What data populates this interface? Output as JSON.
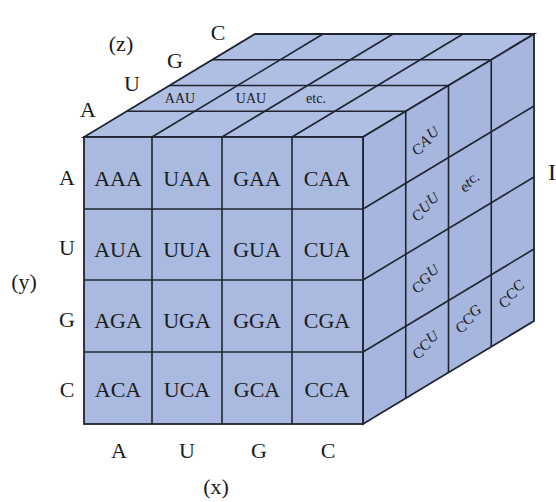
{
  "figure": {
    "colors": {
      "face_fill": "#a9b9e0",
      "face_fill_top": "#afbfe3",
      "face_fill_side": "#a6b6de",
      "line": "#1f2430",
      "text": "#1a1a1a",
      "background": "#ffffff"
    },
    "geometry": {
      "front_x": [
        84,
        152,
        222,
        292,
        363
      ],
      "front_y": [
        137,
        209,
        280,
        352,
        424
      ],
      "depth_dx": 42.75,
      "depth_dy": -25.75,
      "layers": 4
    }
  },
  "axes": {
    "x": {
      "name": "(x)",
      "letters": [
        "A",
        "U",
        "G",
        "C"
      ]
    },
    "y": {
      "name": "(y)",
      "letters": [
        "A",
        "U",
        "G",
        "C"
      ]
    },
    "z": {
      "name": "(z)",
      "letters": [
        "A",
        "U",
        "G",
        "C"
      ]
    }
  },
  "front_face": {
    "rows": [
      [
        "AAA",
        "UAA",
        "GAA",
        "CAA"
      ],
      [
        "AUA",
        "UUA",
        "GUA",
        "CUA"
      ],
      [
        "AGA",
        "UGA",
        "GGA",
        "CGA"
      ],
      [
        "ACA",
        "UCA",
        "GCA",
        "CCA"
      ]
    ]
  },
  "top_face": {
    "labels": [
      "AAU",
      "UAU",
      "etc."
    ]
  },
  "right_face": {
    "labels": [
      {
        "text": "CAU",
        "parts": [
          "C",
          "A",
          "U"
        ]
      },
      {
        "text": "CUU",
        "parts": [
          "C",
          "U",
          "U"
        ]
      },
      {
        "text": "etc.",
        "parts": [
          "e",
          "t",
          "c."
        ]
      },
      {
        "text": "CGU",
        "parts": [
          "C",
          "G",
          "U"
        ]
      },
      {
        "text": "CCU",
        "parts": [
          "C",
          "C",
          "U"
        ]
      },
      {
        "text": "CCG",
        "parts": [
          "C",
          "C",
          "G"
        ]
      },
      {
        "text": "CCC",
        "parts": [
          "C",
          "C",
          "C"
        ]
      }
    ]
  },
  "cropped_edge_glyph": "I"
}
